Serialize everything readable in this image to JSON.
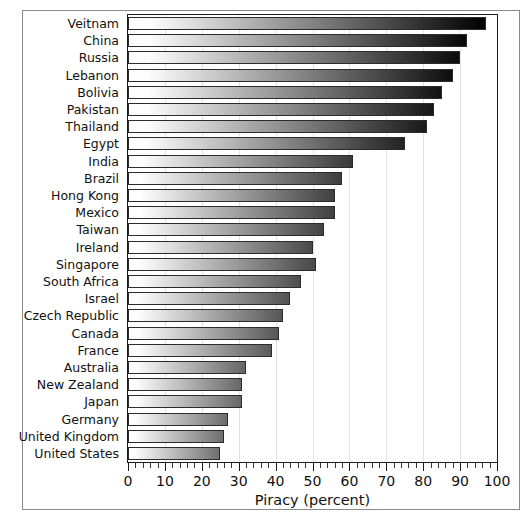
{
  "chart_data": {
    "type": "bar",
    "orientation": "horizontal",
    "title": "",
    "xlabel": "Piracy (percent)",
    "ylabel": "",
    "xlim": [
      0,
      100
    ],
    "ylim": null,
    "grid": true,
    "legend": null,
    "x_major_tick_step": 10,
    "x_minor_tick_step": 2,
    "x_tick_labels": [
      "0",
      "10",
      "20",
      "30",
      "40",
      "50",
      "60",
      "70",
      "80",
      "90",
      "100"
    ],
    "x_tick_values": [
      0,
      10,
      20,
      30,
      40,
      50,
      60,
      70,
      80,
      90,
      100
    ],
    "categories": [
      "Veitnam",
      "China",
      "Russia",
      "Lebanon",
      "Bolivia",
      "Pakistan",
      "Thailand",
      "Egypt",
      "India",
      "Brazil",
      "Hong Kong",
      "Mexico",
      "Taiwan",
      "Ireland",
      "Singapore",
      "South Africa",
      "Israel",
      "Czech Republic",
      "Canada",
      "France",
      "Australia",
      "New Zealand",
      "Japan",
      "Germany",
      "United Kingdom",
      "United States"
    ],
    "values": [
      97,
      92,
      90,
      88,
      85,
      83,
      81,
      75,
      61,
      58,
      56,
      56,
      53,
      50,
      51,
      47,
      44,
      42,
      41,
      39,
      32,
      31,
      31,
      27,
      26,
      25
    ],
    "bar_style": {
      "fill": "horizontal-gradient-white-to-dark",
      "outline": "#2b2b2b",
      "gradient_start": "#ffffff",
      "gradient_end_dark": "#000000",
      "gradient_end_light": "#6f6f6f"
    }
  },
  "axis": {
    "x_title": "Piracy (percent)"
  },
  "colors": {
    "frame": "#8a8a8a",
    "plot_border": "#1a1a1a",
    "gridline": "#e2e2e2",
    "background": "#ffffff",
    "text": "#111111"
  }
}
